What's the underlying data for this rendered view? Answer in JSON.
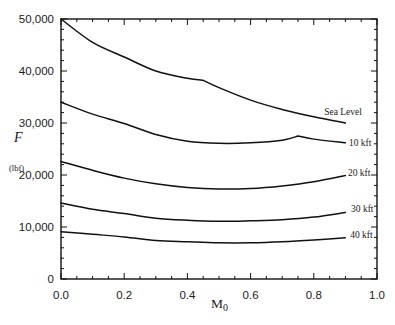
{
  "chart_data": {
    "type": "line",
    "title": "",
    "xlabel": "M0",
    "xlabel_main": "M",
    "xlabel_sub": "0",
    "ylabel": "F",
    "ylabel_unit": "(lbf)",
    "xlim": [
      0.0,
      1.0
    ],
    "ylim": [
      0,
      50000
    ],
    "x_ticks": [
      0.0,
      0.2,
      0.4,
      0.6,
      0.8,
      1.0
    ],
    "x_tick_labels": [
      "0.0",
      "0.2",
      "0.4",
      "0.6",
      "0.8",
      "1.0"
    ],
    "x_minor_step": 0.05,
    "y_ticks": [
      0,
      10000,
      20000,
      30000,
      40000,
      50000
    ],
    "y_tick_labels": [
      "0",
      "10,000",
      "20,000",
      "30,000",
      "40,000",
      "50,000"
    ],
    "y_minor_step": 2000,
    "grid": false,
    "legend": "inline labels at right end of each curve",
    "series": [
      {
        "name": "Sea Level",
        "x": [
          0.0,
          0.1,
          0.2,
          0.3,
          0.4,
          0.45,
          0.5,
          0.6,
          0.7,
          0.8,
          0.9
        ],
        "values": [
          50000,
          45500,
          42700,
          40000,
          38600,
          38200,
          36800,
          34400,
          32600,
          31200,
          30000
        ],
        "break_after": 5,
        "label_at": [
          0.833,
          31500
        ]
      },
      {
        "name": "10 kft",
        "x": [
          0.0,
          0.1,
          0.2,
          0.3,
          0.4,
          0.5,
          0.6,
          0.7,
          0.75,
          0.8,
          0.9
        ],
        "values": [
          34000,
          31700,
          29900,
          27800,
          26500,
          26100,
          26200,
          26700,
          27500,
          26900,
          26200
        ],
        "break_after": 8,
        "label_at": [
          0.911,
          25600
        ]
      },
      {
        "name": "20 kft",
        "x": [
          0.0,
          0.1,
          0.2,
          0.3,
          0.4,
          0.5,
          0.6,
          0.7,
          0.8,
          0.9
        ],
        "values": [
          22600,
          20900,
          19400,
          18300,
          17600,
          17300,
          17400,
          17900,
          18700,
          19900
        ],
        "label_at": [
          0.908,
          19900
        ]
      },
      {
        "name": "30 kft",
        "x": [
          0.0,
          0.1,
          0.2,
          0.3,
          0.4,
          0.5,
          0.6,
          0.7,
          0.8,
          0.9
        ],
        "values": [
          14600,
          13400,
          12600,
          11700,
          11300,
          11100,
          11200,
          11400,
          11900,
          12800
        ],
        "label_at": [
          0.918,
          12800
        ]
      },
      {
        "name": "40 kft",
        "x": [
          0.0,
          0.1,
          0.2,
          0.3,
          0.4,
          0.5,
          0.6,
          0.7,
          0.8,
          0.9
        ],
        "values": [
          9100,
          8600,
          8100,
          7400,
          7150,
          6950,
          6950,
          7150,
          7500,
          7950
        ],
        "label_at": [
          0.915,
          7800
        ]
      }
    ]
  }
}
